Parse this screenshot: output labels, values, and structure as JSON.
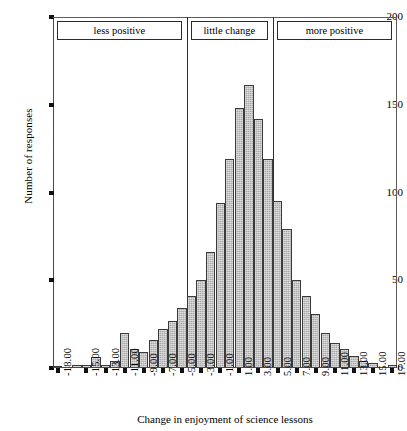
{
  "chart_data": {
    "type": "bar",
    "title": "",
    "xlabel": "Change in enjoyment of science lessons",
    "ylabel": "Number of responses",
    "ylim": [
      0,
      200
    ],
    "yticks": [
      0,
      50,
      100,
      150,
      200
    ],
    "grid": false,
    "legend_position": "none",
    "xtick_labels": [
      "-18.00",
      "-15.00",
      "-13.00",
      "-11.00",
      "-9.00",
      "-7.00",
      "-5.00",
      "-3.00",
      "-1.00",
      "1.00",
      "3.00",
      "5.00",
      "7.00",
      "9.00",
      "11.00",
      "13.00",
      "15.00",
      "17.00"
    ],
    "categories": [
      "-18.00",
      "-17.00",
      "-16.00",
      "-15.00",
      "-14.00",
      "-13.00",
      "-12.00",
      "-11.00",
      "-10.00",
      "-9.00",
      "-8.00",
      "-7.00",
      "-6.00",
      "-5.00",
      "-4.00",
      "-3.00",
      "-2.00",
      "-1.00",
      "0.00",
      "1.00",
      "2.00",
      "3.00",
      "4.00",
      "5.00",
      "6.00",
      "7.00",
      "8.00",
      "9.00",
      "10.00",
      "11.00",
      "12.00",
      "13.00",
      "14.00",
      "15.00",
      "16.00",
      "17.00"
    ],
    "values": [
      1,
      0,
      2,
      2,
      6,
      2,
      4,
      20,
      11,
      9,
      16,
      22,
      27,
      34,
      41,
      50,
      66,
      94,
      119,
      148,
      161,
      142,
      119,
      95,
      79,
      50,
      41,
      31,
      20,
      14,
      11,
      7,
      4,
      3,
      0,
      2
    ],
    "annotations": [
      {
        "label": "less positive",
        "span": [
          "-18.00",
          "-5.00"
        ]
      },
      {
        "label": "little change",
        "span": [
          "-4.00",
          "4.00"
        ]
      },
      {
        "label": "more positive",
        "span": [
          "5.00",
          "17.00"
        ]
      }
    ],
    "colors": {
      "bar_fill": "#a9a9a9",
      "bar_edge": "#3b3b3b",
      "axis": "#4a4a4a",
      "background": "#ffffff"
    }
  },
  "bands": [
    {
      "label": "less positive"
    },
    {
      "label": "little change"
    },
    {
      "label": "more positive"
    }
  ]
}
